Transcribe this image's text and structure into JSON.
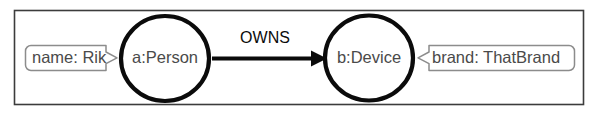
{
  "diagram": {
    "frame": {
      "border_color": "#3c3c3c",
      "background_color": "#ffffff"
    },
    "node_stroke_color": "#0b0b0b",
    "node_text_color": "#4a4a4a",
    "property_box_stroke_color": "#8c8c8c",
    "property_text_color": "#4a4a4a",
    "relationship_color": "#0b0b0b",
    "nodes": [
      {
        "id": "a",
        "label": "a:Person",
        "property": {
          "key": "name",
          "value": "Rik",
          "text": "name: Rik",
          "side": "left"
        }
      },
      {
        "id": "b",
        "label": "b:Device",
        "property": {
          "key": "brand",
          "value": "ThatBrand",
          "text": "brand: ThatBrand",
          "side": "right"
        }
      }
    ],
    "relationships": [
      {
        "type": "OWNS",
        "from": "a",
        "to": "b",
        "direction": "right"
      }
    ]
  }
}
